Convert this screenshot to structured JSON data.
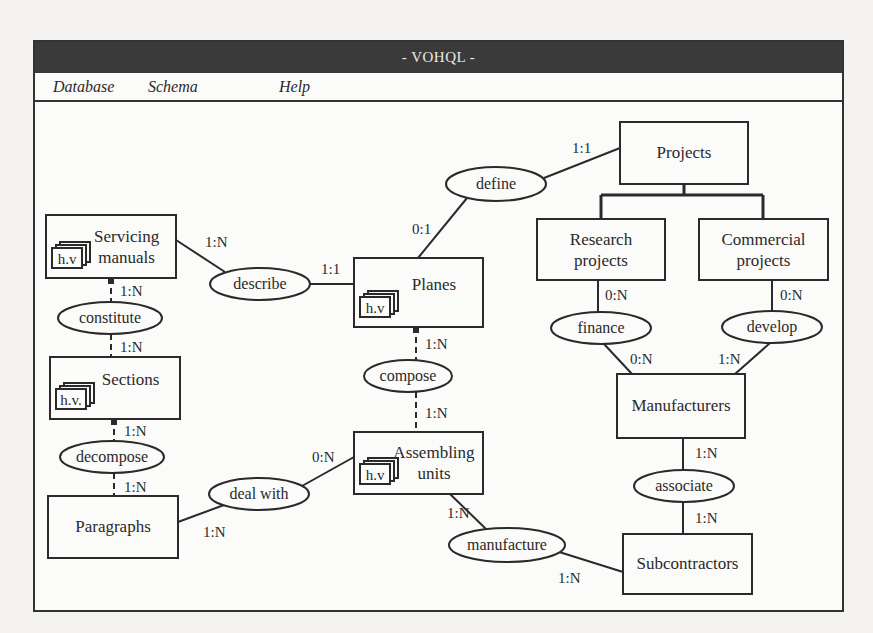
{
  "window": {
    "title": "- VOHQL -"
  },
  "menu": {
    "items": [
      {
        "label": "Database"
      },
      {
        "label": "Schema"
      },
      {
        "label": "Help"
      }
    ]
  },
  "colors": {
    "titlebar": "#3a3a3a",
    "stroke": "#2a2a2a",
    "background": "#fbfbfa"
  },
  "diagram": {
    "entities": [
      {
        "id": "servicing_manuals",
        "lines": [
          "Servicing",
          "manuals"
        ],
        "x": 46,
        "y": 215,
        "w": 130,
        "h": 63,
        "hv": "h.v"
      },
      {
        "id": "sections",
        "lines": [
          "Sections"
        ],
        "x": 50,
        "y": 357,
        "w": 130,
        "h": 62,
        "hv": "h.v."
      },
      {
        "id": "paragraphs",
        "lines": [
          "Paragraphs"
        ],
        "x": 48,
        "y": 496,
        "w": 130,
        "h": 62
      },
      {
        "id": "planes",
        "lines": [
          "Planes"
        ],
        "x": 354,
        "y": 258,
        "w": 129,
        "h": 69,
        "hv": "h.v"
      },
      {
        "id": "assembling_units",
        "lines": [
          "Assembling",
          "units"
        ],
        "x": 354,
        "y": 432,
        "w": 129,
        "h": 62,
        "hv": "h.v"
      },
      {
        "id": "projects",
        "lines": [
          "Projects"
        ],
        "x": 620,
        "y": 122,
        "w": 128,
        "h": 62
      },
      {
        "id": "research_projects",
        "lines": [
          "Research",
          "projects"
        ],
        "x": 537,
        "y": 219,
        "w": 128,
        "h": 61
      },
      {
        "id": "commercial_projects",
        "lines": [
          "Commercial",
          "projects"
        ],
        "x": 699,
        "y": 219,
        "w": 129,
        "h": 61
      },
      {
        "id": "manufacturers",
        "lines": [
          "Manufacturers"
        ],
        "x": 617,
        "y": 374,
        "w": 128,
        "h": 64
      },
      {
        "id": "subcontractors",
        "lines": [
          "Subcontractors"
        ],
        "x": 623,
        "y": 534,
        "w": 129,
        "h": 60
      }
    ],
    "relationships": [
      {
        "id": "define",
        "label": "define",
        "cx": 496,
        "cy": 184,
        "rx": 50,
        "ry": 17
      },
      {
        "id": "describe",
        "label": "describe",
        "cx": 260,
        "cy": 284,
        "rx": 50,
        "ry": 16
      },
      {
        "id": "constitute",
        "label": "constitute",
        "cx": 110,
        "cy": 318,
        "rx": 52,
        "ry": 16
      },
      {
        "id": "compose",
        "label": "compose",
        "cx": 408,
        "cy": 376,
        "rx": 44,
        "ry": 16
      },
      {
        "id": "decompose",
        "label": "decompose",
        "cx": 112,
        "cy": 457,
        "rx": 52,
        "ry": 16
      },
      {
        "id": "deal_with",
        "label": "deal with",
        "cx": 259,
        "cy": 494,
        "rx": 50,
        "ry": 16
      },
      {
        "id": "finance",
        "label": "finance",
        "cx": 601,
        "cy": 328,
        "rx": 50,
        "ry": 16
      },
      {
        "id": "develop",
        "label": "develop",
        "cx": 772,
        "cy": 327,
        "rx": 50,
        "ry": 16
      },
      {
        "id": "associate",
        "label": "associate",
        "cx": 684,
        "cy": 486,
        "rx": 50,
        "ry": 16
      },
      {
        "id": "manufacture",
        "label": "manufacture",
        "cx": 507,
        "cy": 545,
        "rx": 58,
        "ry": 17
      }
    ],
    "links": [
      {
        "from": [
          176,
          240
        ],
        "to": [
          225,
          272
        ],
        "card": "1:N",
        "lx": 205,
        "ly": 247
      },
      {
        "from": [
          310,
          284
        ],
        "to": [
          354,
          284
        ],
        "card": "1:1",
        "lx": 321,
        "ly": 274
      },
      {
        "from": [
          467,
          198
        ],
        "to": [
          418,
          258
        ],
        "card": "0:1",
        "lx": 412,
        "ly": 234
      },
      {
        "from": [
          544,
          178
        ],
        "to": [
          620,
          148
        ],
        "card": "1:1",
        "lx": 572,
        "ly": 153
      },
      {
        "from": [
          111,
          278
        ],
        "to": [
          111,
          302
        ],
        "card": "1:N",
        "lx": 120,
        "ly": 296,
        "dashed": true,
        "knob": true
      },
      {
        "from": [
          111,
          334
        ],
        "to": [
          111,
          357
        ],
        "card": "1:N",
        "lx": 120,
        "ly": 352,
        "dashed": true
      },
      {
        "from": [
          114,
          419
        ],
        "to": [
          114,
          441
        ],
        "card": "1:N",
        "lx": 124,
        "ly": 436,
        "dashed": true,
        "knob": true
      },
      {
        "from": [
          114,
          473
        ],
        "to": [
          114,
          496
        ],
        "card": "1:N",
        "lx": 124,
        "ly": 492,
        "dashed": true
      },
      {
        "from": [
          416,
          327
        ],
        "to": [
          416,
          360
        ],
        "card": "1:N",
        "lx": 425,
        "ly": 349,
        "dashed": true,
        "knob": true
      },
      {
        "from": [
          416,
          392
        ],
        "to": [
          416,
          432
        ],
        "card": "1:N",
        "lx": 425,
        "ly": 418,
        "dashed": true
      },
      {
        "from": [
          178,
          522
        ],
        "to": [
          224,
          505
        ],
        "card": "1:N",
        "lx": 203,
        "ly": 537
      },
      {
        "from": [
          302,
          486
        ],
        "to": [
          354,
          457
        ],
        "card": "0:N",
        "lx": 312,
        "ly": 462
      },
      {
        "from": [
          450,
          494
        ],
        "to": [
          486,
          529
        ],
        "card": "1:N",
        "lx": 447,
        "ly": 518
      },
      {
        "from": [
          556,
          551
        ],
        "to": [
          623,
          572
        ],
        "card": "1:N",
        "lx": 558,
        "ly": 583
      },
      {
        "from": [
          598,
          280
        ],
        "to": [
          598,
          312
        ],
        "card": "0:N",
        "lx": 605,
        "ly": 300
      },
      {
        "from": [
          772,
          280
        ],
        "to": [
          772,
          311
        ],
        "card": "0:N",
        "lx": 780,
        "ly": 300
      },
      {
        "from": [
          604,
          344
        ],
        "to": [
          632,
          374
        ],
        "card": "0:N",
        "lx": 630,
        "ly": 364
      },
      {
        "from": [
          770,
          343
        ],
        "to": [
          735,
          374
        ],
        "card": "1:N",
        "lx": 718,
        "ly": 364
      },
      {
        "from": [
          683,
          438
        ],
        "to": [
          683,
          470
        ],
        "card": "1:N",
        "lx": 695,
        "ly": 458
      },
      {
        "from": [
          683,
          502
        ],
        "to": [
          683,
          534
        ],
        "card": "1:N",
        "lx": 695,
        "ly": 523
      }
    ],
    "isa": {
      "parent_x": 684,
      "parent_y": 184,
      "bar_y": 195,
      "children_x": [
        601,
        763
      ],
      "child_y": 219
    }
  }
}
